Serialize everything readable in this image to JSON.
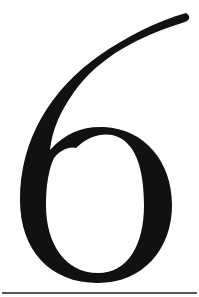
{
  "figure": {
    "glyph": "6",
    "glyph_color": "#111111",
    "background_color": "#ffffff",
    "rule_color": "#555555"
  }
}
